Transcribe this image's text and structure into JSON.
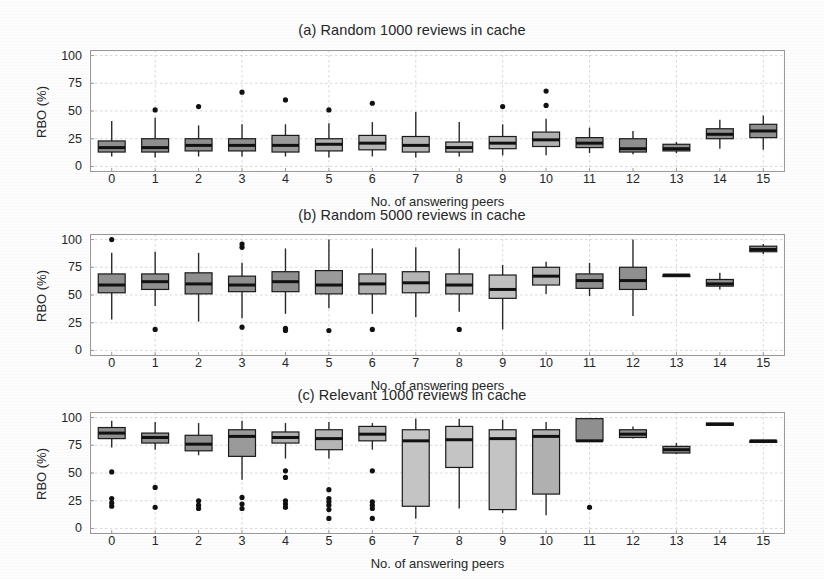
{
  "figure": {
    "width": 824,
    "height": 579,
    "background": "#fdfdfd",
    "axis_color": "#9a9a9a",
    "grid_color": "#cfcfcf",
    "box_fill_dark": "#8f8f8f",
    "box_fill_light": "#b8b8b8",
    "box_edge": "#1a1a1a",
    "median_color": "#111111",
    "whisker_color": "#2b2b2b",
    "outlier_color": "#111111"
  },
  "shared": {
    "xlabel": "No. of answering peers",
    "ylabel": "RBO (%)",
    "yticks": [
      "0",
      "25",
      "50",
      "75",
      "100"
    ],
    "ytick_values": [
      0,
      25,
      50,
      75,
      100
    ],
    "ylim": [
      -5,
      105
    ],
    "xticks": [
      "0",
      "1",
      "2",
      "3",
      "4",
      "5",
      "6",
      "7",
      "8",
      "9",
      "10",
      "11",
      "12",
      "13",
      "14",
      "15"
    ],
    "grid": true,
    "legend": "none"
  },
  "chart_data": [
    {
      "type": "box",
      "id": "panel-a",
      "title": "(a) Random 1000 reviews in cache",
      "xlabel": "No. of answering peers",
      "ylabel": "RBO (%)",
      "ylim": [
        -5,
        105
      ],
      "yticks": [
        0,
        25,
        50,
        75,
        100
      ],
      "categories": [
        "0",
        "1",
        "2",
        "3",
        "4",
        "5",
        "6",
        "7",
        "8",
        "9",
        "10",
        "11",
        "12",
        "13",
        "14",
        "15"
      ],
      "boxes": [
        {
          "x": "0",
          "whisker_low": 9,
          "q1": 13,
          "median": 17,
          "q3": 23,
          "whisker_high": 41,
          "outliers": [],
          "fill": "#8f8f8f"
        },
        {
          "x": "1",
          "whisker_low": 8,
          "q1": 13,
          "median": 17,
          "q3": 25,
          "whisker_high": 44,
          "outliers": [
            51
          ],
          "fill": "#8f8f8f"
        },
        {
          "x": "2",
          "whisker_low": 9,
          "q1": 14,
          "median": 19,
          "q3": 25,
          "whisker_high": 37,
          "outliers": [
            54
          ],
          "fill": "#8f8f8f"
        },
        {
          "x": "3",
          "whisker_low": 9,
          "q1": 14,
          "median": 19,
          "q3": 25,
          "whisker_high": 38,
          "outliers": [
            67
          ],
          "fill": "#8f8f8f"
        },
        {
          "x": "4",
          "whisker_low": 9,
          "q1": 13,
          "median": 19,
          "q3": 28,
          "whisker_high": 38,
          "outliers": [
            60
          ],
          "fill": "#9a9a9a"
        },
        {
          "x": "5",
          "whisker_low": 8,
          "q1": 14,
          "median": 20,
          "q3": 25,
          "whisker_high": 39,
          "outliers": [
            51
          ],
          "fill": "#b0b0b0"
        },
        {
          "x": "6",
          "whisker_low": 9,
          "q1": 15,
          "median": 21,
          "q3": 28,
          "whisker_high": 40,
          "outliers": [
            57
          ],
          "fill": "#b5b5b5"
        },
        {
          "x": "7",
          "whisker_low": 8,
          "q1": 13,
          "median": 19,
          "q3": 27,
          "whisker_high": 49,
          "outliers": [],
          "fill": "#b5b5b5"
        },
        {
          "x": "8",
          "whisker_low": 9,
          "q1": 13,
          "median": 17,
          "q3": 22,
          "whisker_high": 40,
          "outliers": [],
          "fill": "#b5b5b5"
        },
        {
          "x": "9",
          "whisker_low": 10,
          "q1": 16,
          "median": 21,
          "q3": 27,
          "whisker_high": 38,
          "outliers": [
            54
          ],
          "fill": "#b5b5b5"
        },
        {
          "x": "10",
          "whisker_low": 10,
          "q1": 18,
          "median": 24,
          "q3": 31,
          "whisker_high": 43,
          "outliers": [
            55,
            68
          ],
          "fill": "#b0b0b0"
        },
        {
          "x": "11",
          "whisker_low": 12,
          "q1": 17,
          "median": 21,
          "q3": 26,
          "whisker_high": 35,
          "outliers": [],
          "fill": "#8f8f8f"
        },
        {
          "x": "12",
          "whisker_low": 11,
          "q1": 13,
          "median": 16,
          "q3": 25,
          "whisker_high": 32,
          "outliers": [],
          "fill": "#8f8f8f"
        },
        {
          "x": "13",
          "whisker_low": 12,
          "q1": 14,
          "median": 16,
          "q3": 20,
          "whisker_high": 22,
          "outliers": [],
          "fill": "#8f8f8f"
        },
        {
          "x": "14",
          "whisker_low": 16,
          "q1": 25,
          "median": 29,
          "q3": 34,
          "whisker_high": 42,
          "outliers": [],
          "fill": "#8f8f8f"
        },
        {
          "x": "15",
          "whisker_low": 15,
          "q1": 26,
          "median": 32,
          "q3": 38,
          "whisker_high": 46,
          "outliers": [],
          "fill": "#8f8f8f"
        }
      ]
    },
    {
      "type": "box",
      "id": "panel-b",
      "title": "(b) Random 5000 reviews in cache",
      "xlabel": "No. of answering peers",
      "ylabel": "RBO (%)",
      "ylim": [
        -5,
        105
      ],
      "yticks": [
        0,
        25,
        50,
        75,
        100
      ],
      "categories": [
        "0",
        "1",
        "2",
        "3",
        "4",
        "5",
        "6",
        "7",
        "8",
        "9",
        "10",
        "11",
        "12",
        "13",
        "14",
        "15"
      ],
      "boxes": [
        {
          "x": "0",
          "whisker_low": 28,
          "q1": 52,
          "median": 59,
          "q3": 69,
          "whisker_high": 88,
          "outliers": [
            100
          ],
          "fill": "#8f8f8f"
        },
        {
          "x": "1",
          "whisker_low": 40,
          "q1": 55,
          "median": 62,
          "q3": 69,
          "whisker_high": 89,
          "outliers": [
            19
          ],
          "fill": "#8f8f8f"
        },
        {
          "x": "2",
          "whisker_low": 26,
          "q1": 51,
          "median": 60,
          "q3": 70,
          "whisker_high": 88,
          "outliers": [],
          "fill": "#8f8f8f"
        },
        {
          "x": "3",
          "whisker_low": 29,
          "q1": 53,
          "median": 59,
          "q3": 67,
          "whisker_high": 79,
          "outliers": [
            21,
            93,
            96
          ],
          "fill": "#8f8f8f"
        },
        {
          "x": "4",
          "whisker_low": 33,
          "q1": 53,
          "median": 62,
          "q3": 71,
          "whisker_high": 92,
          "outliers": [
            18,
            20
          ],
          "fill": "#8f8f8f"
        },
        {
          "x": "5",
          "whisker_low": 38,
          "q1": 51,
          "median": 59,
          "q3": 72,
          "whisker_high": 100,
          "outliers": [
            18
          ],
          "fill": "#9a9a9a"
        },
        {
          "x": "6",
          "whisker_low": 33,
          "q1": 51,
          "median": 60,
          "q3": 69,
          "whisker_high": 92,
          "outliers": [
            19
          ],
          "fill": "#b0b0b0"
        },
        {
          "x": "7",
          "whisker_low": 30,
          "q1": 52,
          "median": 61,
          "q3": 71,
          "whisker_high": 93,
          "outliers": [],
          "fill": "#b5b5b5"
        },
        {
          "x": "8",
          "whisker_low": 35,
          "q1": 51,
          "median": 59,
          "q3": 69,
          "whisker_high": 92,
          "outliers": [
            19
          ],
          "fill": "#b5b5b5"
        },
        {
          "x": "9",
          "whisker_low": 19,
          "q1": 47,
          "median": 55,
          "q3": 68,
          "whisker_high": 77,
          "outliers": [],
          "fill": "#c0c0c0"
        },
        {
          "x": "10",
          "whisker_low": 51,
          "q1": 59,
          "median": 67,
          "q3": 75,
          "whisker_high": 80,
          "outliers": [],
          "fill": "#b5b5b5"
        },
        {
          "x": "11",
          "whisker_low": 49,
          "q1": 56,
          "median": 63,
          "q3": 69,
          "whisker_high": 79,
          "outliers": [],
          "fill": "#8f8f8f"
        },
        {
          "x": "12",
          "whisker_low": 31,
          "q1": 55,
          "median": 63,
          "q3": 75,
          "whisker_high": 100,
          "outliers": [],
          "fill": "#8f8f8f"
        },
        {
          "x": "13",
          "whisker_low": 68,
          "q1": 68,
          "median": 68,
          "q3": 68,
          "whisker_high": 68,
          "outliers": [],
          "fill": "#8f8f8f"
        },
        {
          "x": "14",
          "whisker_low": 55,
          "q1": 58,
          "median": 60,
          "q3": 64,
          "whisker_high": 70,
          "outliers": [],
          "fill": "#8f8f8f"
        },
        {
          "x": "15",
          "whisker_low": 87,
          "q1": 89,
          "median": 91,
          "q3": 94,
          "whisker_high": 96,
          "outliers": [],
          "fill": "#8f8f8f"
        }
      ]
    },
    {
      "type": "box",
      "id": "panel-c",
      "title": "(c) Relevant 1000 reviews in cache",
      "xlabel": "No. of answering peers",
      "ylabel": "RBO (%)",
      "ylim": [
        -5,
        105
      ],
      "yticks": [
        0,
        25,
        50,
        75,
        100
      ],
      "categories": [
        "0",
        "1",
        "2",
        "3",
        "4",
        "5",
        "6",
        "7",
        "8",
        "9",
        "10",
        "11",
        "12",
        "13",
        "14",
        "15"
      ],
      "boxes": [
        {
          "x": "0",
          "whisker_low": 73,
          "q1": 81,
          "median": 86,
          "q3": 91,
          "whisker_high": 97,
          "outliers": [
            20,
            23,
            27,
            51
          ],
          "fill": "#8f8f8f"
        },
        {
          "x": "1",
          "whisker_low": 71,
          "q1": 77,
          "median": 82,
          "q3": 86,
          "whisker_high": 96,
          "outliers": [
            19,
            37
          ],
          "fill": "#8f8f8f"
        },
        {
          "x": "2",
          "whisker_low": 66,
          "q1": 70,
          "median": 76,
          "q3": 84,
          "whisker_high": 95,
          "outliers": [
            18,
            21,
            25
          ],
          "fill": "#8f8f8f"
        },
        {
          "x": "3",
          "whisker_low": 44,
          "q1": 65,
          "median": 83,
          "q3": 89,
          "whisker_high": 97,
          "outliers": [
            18,
            22,
            28
          ],
          "fill": "#9a9a9a"
        },
        {
          "x": "4",
          "whisker_low": 63,
          "q1": 77,
          "median": 82,
          "q3": 87,
          "whisker_high": 95,
          "outliers": [
            19,
            22,
            25,
            46,
            52
          ],
          "fill": "#b0b0b0"
        },
        {
          "x": "5",
          "whisker_low": 63,
          "q1": 71,
          "median": 81,
          "q3": 89,
          "whisker_high": 96,
          "outliers": [
            9,
            17,
            21,
            24,
            27,
            35
          ],
          "fill": "#b5b5b5"
        },
        {
          "x": "6",
          "whisker_low": 71,
          "q1": 79,
          "median": 85,
          "q3": 92,
          "whisker_high": 95,
          "outliers": [
            9,
            18,
            21,
            24,
            52
          ],
          "fill": "#b5b5b5"
        },
        {
          "x": "7",
          "whisker_low": 9,
          "q1": 20,
          "median": 79,
          "q3": 89,
          "whisker_high": 99,
          "outliers": [],
          "fill": "#c4c4c4"
        },
        {
          "x": "8",
          "whisker_low": 18,
          "q1": 55,
          "median": 80,
          "q3": 92,
          "whisker_high": 99,
          "outliers": [],
          "fill": "#c4c4c4"
        },
        {
          "x": "9",
          "whisker_low": 14,
          "q1": 17,
          "median": 81,
          "q3": 89,
          "whisker_high": 98,
          "outliers": [],
          "fill": "#c4c4c4"
        },
        {
          "x": "10",
          "whisker_low": 12,
          "q1": 31,
          "median": 83,
          "q3": 89,
          "whisker_high": 96,
          "outliers": [],
          "fill": "#b0b0b0"
        },
        {
          "x": "11",
          "whisker_low": 79,
          "q1": 79,
          "median": 79,
          "q3": 99,
          "whisker_high": 99,
          "outliers": [
            19
          ],
          "fill": "#8f8f8f"
        },
        {
          "x": "12",
          "whisker_low": 81,
          "q1": 82,
          "median": 85,
          "q3": 89,
          "whisker_high": 92,
          "outliers": [],
          "fill": "#8f8f8f"
        },
        {
          "x": "13",
          "whisker_low": 67,
          "q1": 68,
          "median": 71,
          "q3": 74,
          "whisker_high": 77,
          "outliers": [],
          "fill": "#8f8f8f"
        },
        {
          "x": "14",
          "whisker_low": 93,
          "q1": 93,
          "median": 94,
          "q3": 95,
          "whisker_high": 95,
          "outliers": [],
          "fill": "#8f8f8f"
        },
        {
          "x": "15",
          "whisker_low": 79,
          "q1": 79,
          "median": 79,
          "q3": 79,
          "whisker_high": 79,
          "outliers": [],
          "fill": "#8f8f8f"
        }
      ]
    }
  ],
  "layout": {
    "panels": [
      {
        "title_y": 22,
        "plot_x": 90,
        "plot_y": 50,
        "plot_w": 695,
        "plot_h": 122,
        "xtick_y": 176,
        "xlabel_y": 176,
        "ylabel_x": 34,
        "ylabel_y": 138
      },
      {
        "title_y": 207,
        "plot_x": 90,
        "plot_y": 234,
        "plot_w": 695,
        "plot_h": 122,
        "xtick_y": 360,
        "xlabel_y": 360,
        "ylabel_x": 34,
        "ylabel_y": 322
      },
      {
        "title_y": 387,
        "plot_x": 90,
        "plot_y": 412,
        "plot_w": 695,
        "plot_h": 122,
        "xtick_y": 538,
        "xlabel_y": 538,
        "ylabel_x": 34,
        "ylabel_y": 500
      }
    ]
  }
}
